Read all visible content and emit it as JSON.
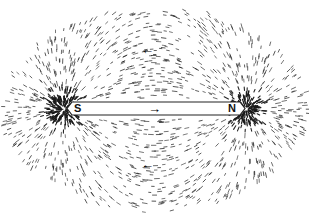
{
  "diagram": {
    "magnet": {
      "south_label": "S",
      "north_label": "N",
      "internal_arrow": "→"
    },
    "field_arrows": {
      "top": "←",
      "bottom": "←"
    },
    "colors": {
      "filings": "#1a1a1a",
      "magnet_fill": "#ffffff",
      "background": "#ffffff"
    }
  }
}
